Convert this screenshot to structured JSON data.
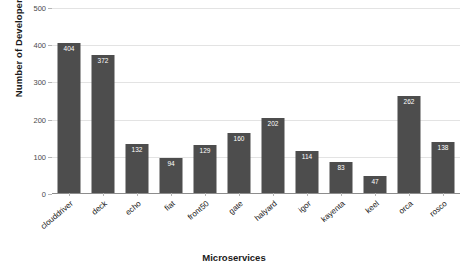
{
  "chart_data": {
    "type": "bar",
    "title": "",
    "xlabel": "Microservices",
    "ylabel": "Number of Developers",
    "categories": [
      "clouddriver",
      "deck",
      "echo",
      "fiat",
      "front50",
      "gate",
      "halyard",
      "igor",
      "kayenta",
      "keel",
      "orca",
      "rosco"
    ],
    "values": [
      404,
      372,
      132,
      94,
      129,
      160,
      202,
      114,
      83,
      47,
      262,
      138
    ],
    "ylim": [
      0,
      500
    ],
    "yticks": [
      0,
      100,
      200,
      300,
      400,
      500
    ],
    "ytick_labels": [
      "0",
      "100",
      "200",
      "300",
      "400",
      "500"
    ],
    "grid": true,
    "legend": "none",
    "bar_color": "#4d4d4d",
    "label_color": "#ffffff",
    "grid_color": "#e3e3e3",
    "axis_color": "#8d8d8d",
    "background": "#ffffff"
  }
}
